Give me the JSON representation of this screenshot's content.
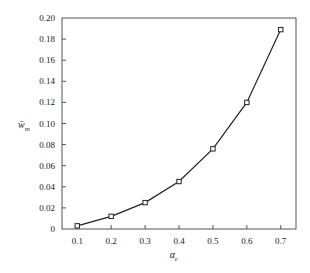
{
  "chart_data": {
    "type": "line",
    "title": "",
    "xlabel": "αc",
    "xlabel_main": "α",
    "xlabel_sub": "c",
    "ylabel": "w̄m",
    "ylabel_main": "w̄",
    "ylabel_sub": "m",
    "x": [
      0.1,
      0.2,
      0.3,
      0.4,
      0.5,
      0.6,
      0.7
    ],
    "series": [
      {
        "name": "w̄m",
        "values": [
          0.003,
          0.012,
          0.025,
          0.045,
          0.076,
          0.12,
          0.189
        ],
        "marker": "square",
        "color": "#222222"
      }
    ],
    "xticks": [
      "0.1",
      "0.2",
      "0.3",
      "0.4",
      "0.5",
      "0.6",
      "0.7"
    ],
    "xtick_values": [
      0.1,
      0.2,
      0.3,
      0.4,
      0.5,
      0.6,
      0.7
    ],
    "yticks": [
      "0",
      "0.02",
      "0.04",
      "0.06",
      "0.08",
      "0.10",
      "0.12",
      "0.14",
      "0.16",
      "0.18",
      "0.20"
    ],
    "ytick_values": [
      0,
      0.02,
      0.04,
      0.06,
      0.08,
      0.1,
      0.12,
      0.14,
      0.16,
      0.18,
      0.2
    ],
    "xlim": [
      0.055,
      0.745
    ],
    "ylim": [
      0,
      0.2
    ],
    "grid": false,
    "legend": "none"
  }
}
